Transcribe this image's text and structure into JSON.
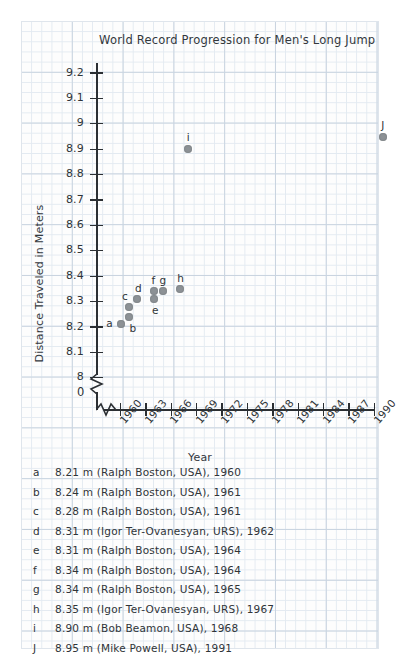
{
  "chart_data": {
    "type": "scatter",
    "title": "World Record Progression for Men's Long Jump",
    "xlabel": "Year",
    "ylabel": "Distance Traveled in Meters",
    "xlim": [
      1959,
      1992
    ],
    "ylim": [
      8.0,
      9.25
    ],
    "grid": true,
    "axis_break_y": true,
    "axis_break_x": true,
    "y_ticks": [
      "9.2",
      "9.1",
      "9",
      "8.9",
      "8.8",
      "8.7",
      "8.6",
      "8.5",
      "8.4",
      "8.3",
      "8.2",
      "8.1",
      "8"
    ],
    "y_tick_values": [
      9.2,
      9.1,
      9.0,
      8.9,
      8.8,
      8.7,
      8.6,
      8.5,
      8.4,
      8.3,
      8.2,
      8.1,
      8.0
    ],
    "origin_label": "0",
    "x_ticks": [
      "1960",
      "1963",
      "1966",
      "1969",
      "1972",
      "1975",
      "1978",
      "1981",
      "1984",
      "1987",
      "1990"
    ],
    "x_tick_values": [
      1960,
      1963,
      1966,
      1969,
      1972,
      1975,
      1978,
      1981,
      1984,
      1987,
      1990
    ],
    "point_color": "#8d9296",
    "points": [
      {
        "key": "a",
        "x": 1960,
        "y": 8.21,
        "label_dx": -11,
        "label_dy": -1
      },
      {
        "key": "b",
        "x": 1961,
        "y": 8.24,
        "label_dx": 4,
        "label_dy": 11
      },
      {
        "key": "c",
        "x": 1961,
        "y": 8.28,
        "label_dx": -4,
        "label_dy": -11
      },
      {
        "key": "d",
        "x": 1962,
        "y": 8.31,
        "label_dx": 1,
        "label_dy": -11
      },
      {
        "key": "e",
        "x": 1964,
        "y": 8.31,
        "label_dx": 1,
        "label_dy": 11
      },
      {
        "key": "f",
        "x": 1964,
        "y": 8.34,
        "label_dx": -1,
        "label_dy": -11
      },
      {
        "key": "g",
        "x": 1965,
        "y": 8.34,
        "label_dx": 0,
        "label_dy": -11
      },
      {
        "key": "h",
        "x": 1967,
        "y": 8.35,
        "label_dx": 1,
        "label_dy": -11
      },
      {
        "key": "i",
        "x": 1968,
        "y": 8.9,
        "label_dx": 0,
        "label_dy": -12
      },
      {
        "key": "J",
        "x": 1991,
        "y": 8.95,
        "label_dx": 0,
        "label_dy": -12
      }
    ],
    "legend": [
      {
        "key": "a",
        "text": "8.21 m (Ralph Boston, USA), 1960"
      },
      {
        "key": "b",
        "text": "8.24 m (Ralph Boston, USA), 1961"
      },
      {
        "key": "c",
        "text": "8.28 m (Ralph Boston, USA), 1961"
      },
      {
        "key": "d",
        "text": "8.31 m (Igor Ter-Ovanesyan, URS), 1962"
      },
      {
        "key": "e",
        "text": "8.31 m (Ralph Boston, USA), 1964"
      },
      {
        "key": "f",
        "text": "8.34 m (Ralph Boston, USA), 1964"
      },
      {
        "key": "g",
        "text": "8.34 m (Ralph Boston, USA), 1965"
      },
      {
        "key": "h",
        "text": "8.35 m (Igor Ter-Ovanesyan, URS), 1967"
      },
      {
        "key": "i",
        "text": "8.90 m (Bob Beamon, USA), 1968"
      },
      {
        "key": "J",
        "text": "8.95 m (Mike Powell, USA), 1991"
      }
    ]
  }
}
